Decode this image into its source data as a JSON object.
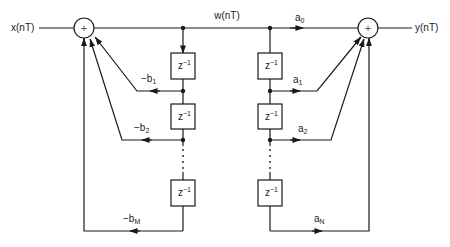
{
  "diagram": {
    "type": "IIR filter direct form II block diagram",
    "input_label": "x(nT)",
    "output_label": "y(nT)",
    "state_label": "w(nT)",
    "adder_symbol": "+",
    "delay_label": "z",
    "delay_exponent": "−1",
    "feedback_taps": [
      {
        "prefix": "−b",
        "sub": "1"
      },
      {
        "prefix": "−b",
        "sub": "2"
      },
      {
        "prefix": "−b",
        "sub": "M"
      }
    ],
    "feedforward_taps": [
      {
        "prefix": "a",
        "sub": "0"
      },
      {
        "prefix": "a",
        "sub": "1"
      },
      {
        "prefix": "a",
        "sub": "2"
      },
      {
        "prefix": "a",
        "sub": "N"
      }
    ],
    "ellipsis": "⋮"
  }
}
